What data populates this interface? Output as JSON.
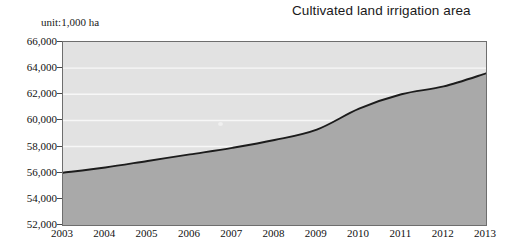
{
  "chart_data": {
    "type": "area",
    "title": "Cultivated land irrigation area",
    "unit_label": "unit:1,000 ha",
    "xlabel": "",
    "ylabel": "",
    "categories": [
      "2003",
      "2004",
      "2005",
      "2006",
      "2007",
      "2008",
      "2009",
      "2010",
      "2011",
      "2012",
      "2013"
    ],
    "values": [
      56000,
      56400,
      56900,
      57400,
      57900,
      58500,
      59300,
      60900,
      62000,
      62600,
      63600
    ],
    "series": [
      {
        "name": "Cultivated land irrigation area",
        "values": [
          56000,
          56400,
          56900,
          57400,
          57900,
          58500,
          59300,
          60900,
          62000,
          62600,
          63600
        ]
      }
    ],
    "ylim": [
      52000,
      66000
    ],
    "ytick_labels": [
      "66,000",
      "64,000",
      "62,000",
      "60,000",
      "58,000",
      "56,000",
      "54,000",
      "52,000"
    ],
    "ytick_values": [
      66000,
      64000,
      62000,
      60000,
      58000,
      56000,
      54000,
      52000
    ],
    "xtick_labels": [
      "2003",
      "2004",
      "2005",
      "2006",
      "2007",
      "2008",
      "2009",
      "2010",
      "2011",
      "2012",
      "2013"
    ],
    "grid": true,
    "gridline_color": "#f7f7f7",
    "legend": "none",
    "colors": {
      "area_fill": "#a9a9a9",
      "plot_background": "#e2e2e2",
      "line": "#1c1c1c",
      "axis": "#6e6e6e",
      "text": "#111111"
    }
  }
}
